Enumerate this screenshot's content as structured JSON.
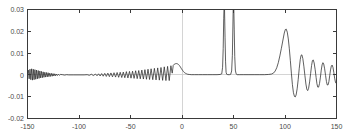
{
  "chart_data": {
    "type": "line",
    "title": "",
    "subtitle": "",
    "xlabel": "",
    "ylabel": "",
    "xlim": [
      -150,
      150
    ],
    "ylim": [
      -0.02,
      0.03
    ],
    "grid": false,
    "legend": null,
    "legend_position": "none",
    "line_color": "#2b2b2b",
    "background_color": "#ffffff",
    "axis_color": "#3a3a3a",
    "zero_grid_color": "#c9c9c9",
    "x_ticks": [
      -150,
      -100,
      -50,
      0,
      50,
      100,
      150
    ],
    "x_tick_labels": [
      "-150",
      "-100",
      "-50",
      "0",
      "50",
      "100",
      "150"
    ],
    "y_ticks": [
      -0.02,
      -0.01,
      0,
      0.01,
      0.02,
      0.03
    ],
    "y_tick_labels": [
      "-0.02",
      "-0.01",
      "0",
      "0.01",
      "0.02",
      "0.03"
    ],
    "annotations": [
      {
        "text": "clipped spike",
        "x": 41,
        "y": 0.03
      },
      {
        "text": "clipped spike",
        "x": 50,
        "y": 0.03
      }
    ],
    "series": [
      {
        "name": "signal",
        "color": "#2b2b2b",
        "description": "Oscillatory waveform: decaying ripples at far left, growing ripples approaching x=0 with a hump near x=-5, flat plateau from x=5 to x=38, two tall narrow spikes clipped above 0.03 at x=41 and x=50, flat plateau to x=88, a large positive lobe peaking 0.021 near x=100, a trough of -0.010 near x=110, then decaying oscillations to x=150",
        "points": [
          [
            -150,
            0.0002
          ],
          [
            -149.2,
            0.0022
          ],
          [
            -148.4,
            -0.0018
          ],
          [
            -147.6,
            0.0026
          ],
          [
            -146.8,
            -0.0022
          ],
          [
            -146,
            0.0028
          ],
          [
            -145.2,
            -0.0024
          ],
          [
            -144.4,
            0.0026
          ],
          [
            -143.6,
            -0.0022
          ],
          [
            -142.8,
            0.0024
          ],
          [
            -142,
            -0.002
          ],
          [
            -141.2,
            0.0022
          ],
          [
            -140.4,
            -0.0018
          ],
          [
            -139.6,
            0.002
          ],
          [
            -138.8,
            -0.0016
          ],
          [
            -138,
            0.0018
          ],
          [
            -137.2,
            -0.0014
          ],
          [
            -136.4,
            0.0016
          ],
          [
            -135.6,
            -0.0013
          ],
          [
            -134.8,
            0.0014
          ],
          [
            -134,
            -0.0011
          ],
          [
            -133.2,
            0.0012
          ],
          [
            -132.4,
            -0.001
          ],
          [
            -131.6,
            0.0011
          ],
          [
            -130.8,
            -0.0009
          ],
          [
            -130,
            0.001
          ],
          [
            -129.2,
            -0.0008
          ],
          [
            -128.4,
            0.0008
          ],
          [
            -127.6,
            -0.0007
          ],
          [
            -126.8,
            0.0007
          ],
          [
            -126,
            -0.0006
          ],
          [
            -125.2,
            0.0006
          ],
          [
            -124.4,
            -0.0005
          ],
          [
            -123.6,
            0.0005
          ],
          [
            -122.8,
            -0.0004
          ],
          [
            -122,
            0.0004
          ],
          [
            -121,
            -0.0003
          ],
          [
            -120,
            0.0003
          ],
          [
            -119,
            -0.0002
          ],
          [
            -118,
            0.0002
          ],
          [
            -116,
            0.0001
          ],
          [
            -114,
            -0.0001
          ],
          [
            -112,
            0.0001
          ],
          [
            -110,
            0.0
          ],
          [
            -105,
            0.0
          ],
          [
            -100,
            0.0
          ],
          [
            -95,
            0.0
          ],
          [
            -92,
            0.0001
          ],
          [
            -90,
            -0.0002
          ],
          [
            -88,
            0.0003
          ],
          [
            -86,
            -0.0003
          ],
          [
            -84,
            0.0004
          ],
          [
            -82.5,
            -0.0004
          ],
          [
            -81,
            0.0005
          ],
          [
            -79.5,
            -0.0005
          ],
          [
            -78,
            0.0006
          ],
          [
            -76.5,
            -0.0006
          ],
          [
            -75,
            0.0007
          ],
          [
            -73.5,
            -0.0007
          ],
          [
            -72,
            0.0008
          ],
          [
            -70.5,
            -0.0008
          ],
          [
            -69,
            0.0009
          ],
          [
            -67.5,
            -0.0009
          ],
          [
            -66,
            0.001
          ],
          [
            -64.5,
            -0.001
          ],
          [
            -63,
            0.0011
          ],
          [
            -61.5,
            -0.0011
          ],
          [
            -60,
            0.0012
          ],
          [
            -58.5,
            -0.0012
          ],
          [
            -57,
            0.0013
          ],
          [
            -55.5,
            -0.0013
          ],
          [
            -54,
            0.0015
          ],
          [
            -52.5,
            -0.0014
          ],
          [
            -51,
            0.0016
          ],
          [
            -49.5,
            -0.0015
          ],
          [
            -48,
            0.0017
          ],
          [
            -46.5,
            -0.0016
          ],
          [
            -45,
            0.0019
          ],
          [
            -43.5,
            -0.0017
          ],
          [
            -42,
            0.002
          ],
          [
            -40.5,
            -0.0018
          ],
          [
            -39,
            0.0022
          ],
          [
            -37.5,
            -0.0019
          ],
          [
            -36,
            0.0024
          ],
          [
            -34.5,
            -0.002
          ],
          [
            -33,
            0.0026
          ],
          [
            -31.5,
            -0.0021
          ],
          [
            -30,
            0.0028
          ],
          [
            -28.4,
            -0.0022
          ],
          [
            -26.8,
            0.003
          ],
          [
            -25.2,
            -0.0023
          ],
          [
            -23.6,
            0.0032
          ],
          [
            -22,
            -0.0024
          ],
          [
            -20.4,
            0.0034
          ],
          [
            -18.8,
            -0.0025
          ],
          [
            -17.2,
            0.0037
          ],
          [
            -15.6,
            -0.0026
          ],
          [
            -14,
            0.0039
          ],
          [
            -12.4,
            -0.0026
          ],
          [
            -10.8,
            0.0042
          ],
          [
            -9.5,
            0.0008
          ],
          [
            -8.5,
            0.0044
          ],
          [
            -7.5,
            0.0049
          ],
          [
            -6.5,
            0.0051
          ],
          [
            -5.5,
            0.0052
          ],
          [
            -4.5,
            0.0051
          ],
          [
            -3.5,
            0.0048
          ],
          [
            -2.5,
            0.0043
          ],
          [
            -1.5,
            0.0036
          ],
          [
            -0.5,
            0.0028
          ],
          [
            0.5,
            0.0021
          ],
          [
            1.5,
            0.0015
          ],
          [
            2.5,
            0.001
          ],
          [
            3.5,
            0.0007
          ],
          [
            4.5,
            0.0005
          ],
          [
            5.5,
            0.0003
          ],
          [
            7,
            0.0002
          ],
          [
            9,
            0.0001
          ],
          [
            12,
            0.0001
          ],
          [
            16,
            0.0001
          ],
          [
            20,
            0.0001
          ],
          [
            25,
            0.0001
          ],
          [
            30,
            0.0001
          ],
          [
            34,
            0.0001
          ],
          [
            37,
            0.0002
          ],
          [
            38.6,
            0.0005
          ],
          [
            39.4,
            0.0035
          ],
          [
            40,
            0.012
          ],
          [
            40.5,
            0.026
          ],
          [
            40.9,
            0.032
          ],
          [
            41.3,
            0.03
          ],
          [
            41.8,
            0.017
          ],
          [
            42.3,
            0.006
          ],
          [
            42.8,
            0.0012
          ],
          [
            43.4,
            0.0003
          ],
          [
            44.5,
            0.0001
          ],
          [
            46,
            0.0001
          ],
          [
            47.3,
            0.0003
          ],
          [
            48.2,
            0.0018
          ],
          [
            48.9,
            0.009
          ],
          [
            49.4,
            0.022
          ],
          [
            49.8,
            0.033
          ],
          [
            50.2,
            0.033
          ],
          [
            50.7,
            0.021
          ],
          [
            51.2,
            0.0085
          ],
          [
            51.8,
            0.0022
          ],
          [
            52.5,
            0.0005
          ],
          [
            53.5,
            0.0001
          ],
          [
            56,
            0.0001
          ],
          [
            60,
            0.0001
          ],
          [
            65,
            0.0001
          ],
          [
            70,
            0.0001
          ],
          [
            75,
            0.0001
          ],
          [
            80,
            0.0001
          ],
          [
            84,
            0.0002
          ],
          [
            87,
            0.0004
          ],
          [
            89,
            0.0009
          ],
          [
            90.5,
            0.0018
          ],
          [
            92,
            0.0033
          ],
          [
            93.5,
            0.0056
          ],
          [
            95,
            0.0087
          ],
          [
            96.5,
            0.0122
          ],
          [
            98,
            0.016
          ],
          [
            99.3,
            0.0192
          ],
          [
            100.3,
            0.0208
          ],
          [
            101.2,
            0.021
          ],
          [
            102.2,
            0.0196
          ],
          [
            103.2,
            0.0165
          ],
          [
            104.2,
            0.012
          ],
          [
            105.2,
            0.0065
          ],
          [
            106.2,
            0.0008
          ],
          [
            107.2,
            -0.0045
          ],
          [
            108.2,
            -0.0082
          ],
          [
            109.2,
            -0.0099
          ],
          [
            110,
            -0.0101
          ],
          [
            110.8,
            -0.0092
          ],
          [
            111.8,
            -0.0064
          ],
          [
            112.8,
            -0.0022
          ],
          [
            113.8,
            0.0028
          ],
          [
            114.8,
            0.007
          ],
          [
            115.6,
            0.009
          ],
          [
            116.4,
            0.0092
          ],
          [
            117.3,
            0.0075
          ],
          [
            118.3,
            0.004
          ],
          [
            119.3,
            -0.0002
          ],
          [
            120.3,
            -0.0042
          ],
          [
            121.2,
            -0.0066
          ],
          [
            122,
            -0.0072
          ],
          [
            122.9,
            -0.0062
          ],
          [
            123.9,
            -0.0032
          ],
          [
            124.9,
            0.0007
          ],
          [
            125.8,
            0.0043
          ],
          [
            126.6,
            0.0065
          ],
          [
            127.4,
            0.0069
          ],
          [
            128.3,
            0.0055
          ],
          [
            129.3,
            0.0024
          ],
          [
            130.2,
            -0.0012
          ],
          [
            131,
            -0.0041
          ],
          [
            131.8,
            -0.0056
          ],
          [
            132.6,
            -0.0056
          ],
          [
            133.5,
            -0.004
          ],
          [
            134.4,
            -0.001
          ],
          [
            135.2,
            0.0022
          ],
          [
            136,
            0.0046
          ],
          [
            136.8,
            0.0056
          ],
          [
            137.6,
            0.005
          ],
          [
            138.5,
            0.0028
          ],
          [
            139.4,
            -0.0003
          ],
          [
            140.2,
            -0.003
          ],
          [
            141,
            -0.0046
          ],
          [
            141.8,
            -0.0046
          ],
          [
            142.6,
            -0.0031
          ],
          [
            143.4,
            -0.0004
          ],
          [
            144.2,
            0.0023
          ],
          [
            145,
            0.0041
          ],
          [
            145.8,
            0.0045
          ],
          [
            146.6,
            0.0034
          ],
          [
            147.4,
            0.0011
          ],
          [
            148.2,
            -0.0015
          ],
          [
            149,
            -0.0034
          ],
          [
            149.6,
            -0.0038
          ],
          [
            150,
            -0.003
          ]
        ]
      }
    ]
  }
}
